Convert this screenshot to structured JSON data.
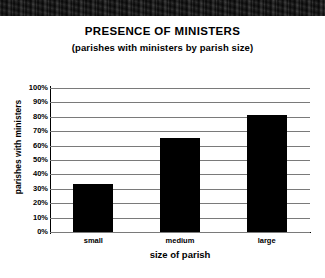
{
  "document": {
    "scan_band_color": "#151515",
    "background_color": "#ffffff"
  },
  "chart_data": {
    "type": "bar",
    "title": "PRESENCE OF MINISTERS",
    "subtitle": "(parishes with ministers by parish size)",
    "xlabel": "size of parish",
    "ylabel": "parishes with ministers",
    "categories": [
      "small",
      "medium",
      "large"
    ],
    "values": [
      33,
      65,
      81
    ],
    "ylim": [
      0,
      100
    ],
    "ytick_labels": [
      "100%",
      "90%",
      "80%",
      "70%",
      "60%",
      "50%",
      "40%",
      "30%",
      "20%",
      "10%",
      "0%"
    ],
    "ytick_values": [
      100,
      90,
      80,
      70,
      60,
      50,
      40,
      30,
      20,
      10,
      0
    ],
    "grid": true,
    "legend": "none",
    "bar_color": "#000000",
    "gridline_color": "#7a7a7a",
    "axis_color": "#000000"
  }
}
